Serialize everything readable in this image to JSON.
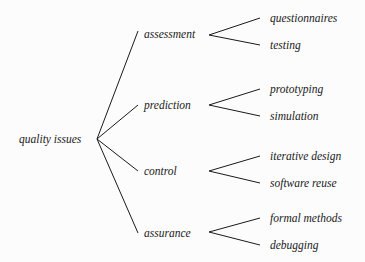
{
  "diagram": {
    "root": {
      "label": "quality issues"
    },
    "branches": [
      {
        "label": "assessment",
        "children": [
          {
            "label": "questionnaires"
          },
          {
            "label": "testing"
          }
        ]
      },
      {
        "label": "prediction",
        "children": [
          {
            "label": "prototyping"
          },
          {
            "label": "simulation"
          }
        ]
      },
      {
        "label": "control",
        "children": [
          {
            "label": "iterative design"
          },
          {
            "label": "software reuse"
          }
        ]
      },
      {
        "label": "assurance",
        "children": [
          {
            "label": "formal methods"
          },
          {
            "label": "debugging"
          }
        ]
      }
    ]
  }
}
